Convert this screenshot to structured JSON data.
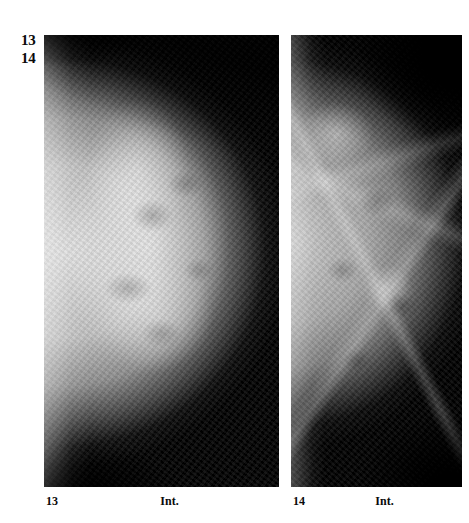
{
  "figure": {
    "corner_index": [
      "13",
      "14"
    ],
    "panels": [
      {
        "id": "panel-left",
        "figure_number": "13",
        "side_marker": "Int.",
        "modality": "mammogram",
        "description": "Dense fibroglandular breast, craniocaudal projection, convex parenchymal disc"
      },
      {
        "id": "panel-right",
        "figure_number": "14",
        "side_marker": "Int.",
        "modality": "mammogram",
        "description": "Fatty-replaced breast with visible trabecular and fibrous strands"
      }
    ]
  },
  "colors": {
    "page_background": "#ffffff",
    "film_background": "#050505",
    "text": "#0a0a0a"
  }
}
